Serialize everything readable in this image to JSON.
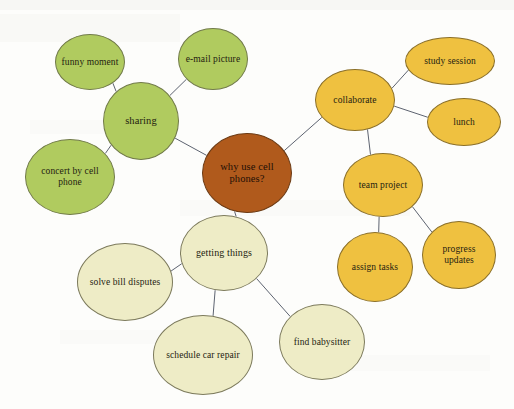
{
  "diagram": {
    "type": "mind-map",
    "title": "why use cell phones?",
    "background_color": "#fdfdfb",
    "palette": {
      "green": "#b0cb5f",
      "orange": "#efc140",
      "cream": "#eeecc6",
      "brown": "#b05a1c",
      "edge": "#5d6370",
      "text": "#241c10"
    },
    "nodes": [
      {
        "id": "center",
        "label": "why use cell phones?",
        "group": "brown",
        "cx": 247,
        "cy": 173,
        "rx": 45,
        "ry": 40,
        "font_size": 10.5
      },
      {
        "id": "sharing",
        "label": "sharing",
        "group": "green",
        "cx": 141,
        "cy": 121,
        "rx": 38,
        "ry": 39,
        "font_size": 10.5
      },
      {
        "id": "funny",
        "label": "funny moment",
        "group": "green",
        "cx": 90,
        "cy": 62,
        "rx": 35,
        "ry": 28,
        "font_size": 9.5
      },
      {
        "id": "email",
        "label": "e-mail picture",
        "group": "green",
        "cx": 213,
        "cy": 59,
        "rx": 35,
        "ry": 31,
        "font_size": 9.5
      },
      {
        "id": "concert",
        "label": "concert by cell phone",
        "group": "green",
        "cx": 70,
        "cy": 177,
        "rx": 45,
        "ry": 38,
        "font_size": 9.5
      },
      {
        "id": "collaborate",
        "label": "collaborate",
        "group": "orange",
        "cx": 355,
        "cy": 100,
        "rx": 40,
        "ry": 31,
        "font_size": 9.5
      },
      {
        "id": "study",
        "label": "study session",
        "group": "orange",
        "cx": 450,
        "cy": 61,
        "rx": 45,
        "ry": 24,
        "font_size": 9.5
      },
      {
        "id": "lunch",
        "label": "lunch",
        "group": "orange",
        "cx": 464,
        "cy": 122,
        "rx": 37,
        "ry": 24,
        "font_size": 9.5
      },
      {
        "id": "team",
        "label": "team project",
        "group": "orange",
        "cx": 383,
        "cy": 185,
        "rx": 40,
        "ry": 32,
        "font_size": 9.5
      },
      {
        "id": "assign",
        "label": "assign tasks",
        "group": "orange",
        "cx": 375,
        "cy": 267,
        "rx": 38,
        "ry": 35,
        "font_size": 9.5
      },
      {
        "id": "progress",
        "label": "progress updates",
        "group": "orange",
        "cx": 459,
        "cy": 255,
        "rx": 37,
        "ry": 34,
        "font_size": 9.5
      },
      {
        "id": "getting",
        "label": "getting things",
        "group": "cream",
        "cx": 224,
        "cy": 253,
        "rx": 44,
        "ry": 38,
        "font_size": 10
      },
      {
        "id": "solve",
        "label": "solve bill disputes",
        "group": "cream",
        "cx": 125,
        "cy": 282,
        "rx": 48,
        "ry": 39,
        "font_size": 9.5
      },
      {
        "id": "schedule",
        "label": "schedule car repair",
        "group": "cream",
        "cx": 203,
        "cy": 355,
        "rx": 50,
        "ry": 40,
        "font_size": 9.5
      },
      {
        "id": "babysitter",
        "label": "find babysitter",
        "group": "cream",
        "cx": 322,
        "cy": 342,
        "rx": 43,
        "ry": 38,
        "font_size": 9.5
      }
    ],
    "edges": [
      {
        "from": "center",
        "to": "sharing"
      },
      {
        "from": "center",
        "to": "collaborate"
      },
      {
        "from": "center",
        "to": "getting"
      },
      {
        "from": "sharing",
        "to": "funny"
      },
      {
        "from": "sharing",
        "to": "email"
      },
      {
        "from": "sharing",
        "to": "concert"
      },
      {
        "from": "collaborate",
        "to": "study"
      },
      {
        "from": "collaborate",
        "to": "lunch"
      },
      {
        "from": "collaborate",
        "to": "team"
      },
      {
        "from": "team",
        "to": "assign"
      },
      {
        "from": "team",
        "to": "progress"
      },
      {
        "from": "getting",
        "to": "solve"
      },
      {
        "from": "getting",
        "to": "schedule"
      },
      {
        "from": "getting",
        "to": "babysitter"
      }
    ]
  }
}
